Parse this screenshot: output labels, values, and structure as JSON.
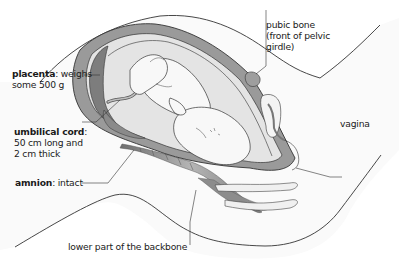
{
  "diagram": {
    "type": "anatomical cross-section",
    "colors": {
      "outline": "#333333",
      "uterus_wall": "#9a9a9a",
      "placenta": "#7d7d7d",
      "amniotic_fluid": "#e6e6e6",
      "fetus_fill": "#f7f7f7",
      "backbone": "#8a8a8a",
      "body_fill": "#fafafa"
    }
  },
  "labels": {
    "placenta": {
      "term": "placenta",
      "desc_line1": ": weighs",
      "desc_line2": "some 500 g"
    },
    "umbilical_cord": {
      "term": "umbilical cord",
      "desc_line1": ":",
      "desc_line2": "50 cm long and",
      "desc_line3": "2 cm thick"
    },
    "amnion": {
      "term": "amnion",
      "desc_line1": ": intact"
    },
    "pubic_bone": {
      "line1": "pubic bone",
      "line2": "(front of pelvic",
      "line3": "girdle)"
    },
    "vagina": {
      "line1": "vagina"
    },
    "backbone": {
      "line1": "lower part of the backbone"
    }
  }
}
